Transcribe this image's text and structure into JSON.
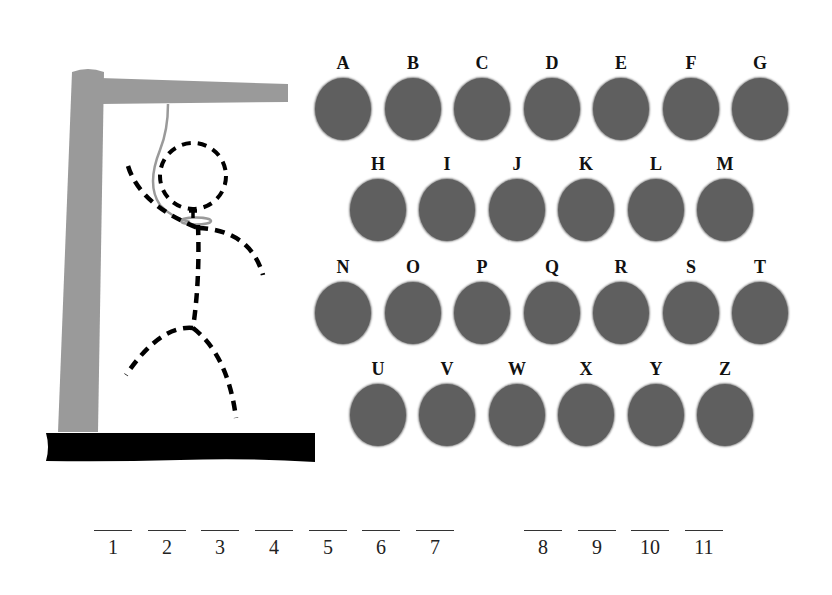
{
  "game": {
    "title": "Hangman",
    "colors": {
      "post": "#9a9a9a",
      "base": "#000000",
      "key": "#5f5f5f",
      "rope": "#9a9a9a",
      "figure": "#000000"
    },
    "figure_parts_shown": [
      "head",
      "body",
      "left-arm",
      "right-arm",
      "left-leg",
      "right-leg",
      "noose"
    ]
  },
  "keyboard": {
    "rows": [
      [
        "A",
        "B",
        "C",
        "D",
        "E",
        "F",
        "G"
      ],
      [
        "H",
        "I",
        "J",
        "K",
        "L",
        "M"
      ],
      [
        "N",
        "O",
        "P",
        "Q",
        "R",
        "S",
        "T"
      ],
      [
        "U",
        "V",
        "W",
        "X",
        "Y",
        "Z"
      ]
    ]
  },
  "word": {
    "words": [
      {
        "slots": [
          "1",
          "2",
          "3",
          "4",
          "5",
          "6",
          "7"
        ]
      },
      {
        "slots": [
          "8",
          "9",
          "10",
          "11"
        ]
      }
    ]
  }
}
